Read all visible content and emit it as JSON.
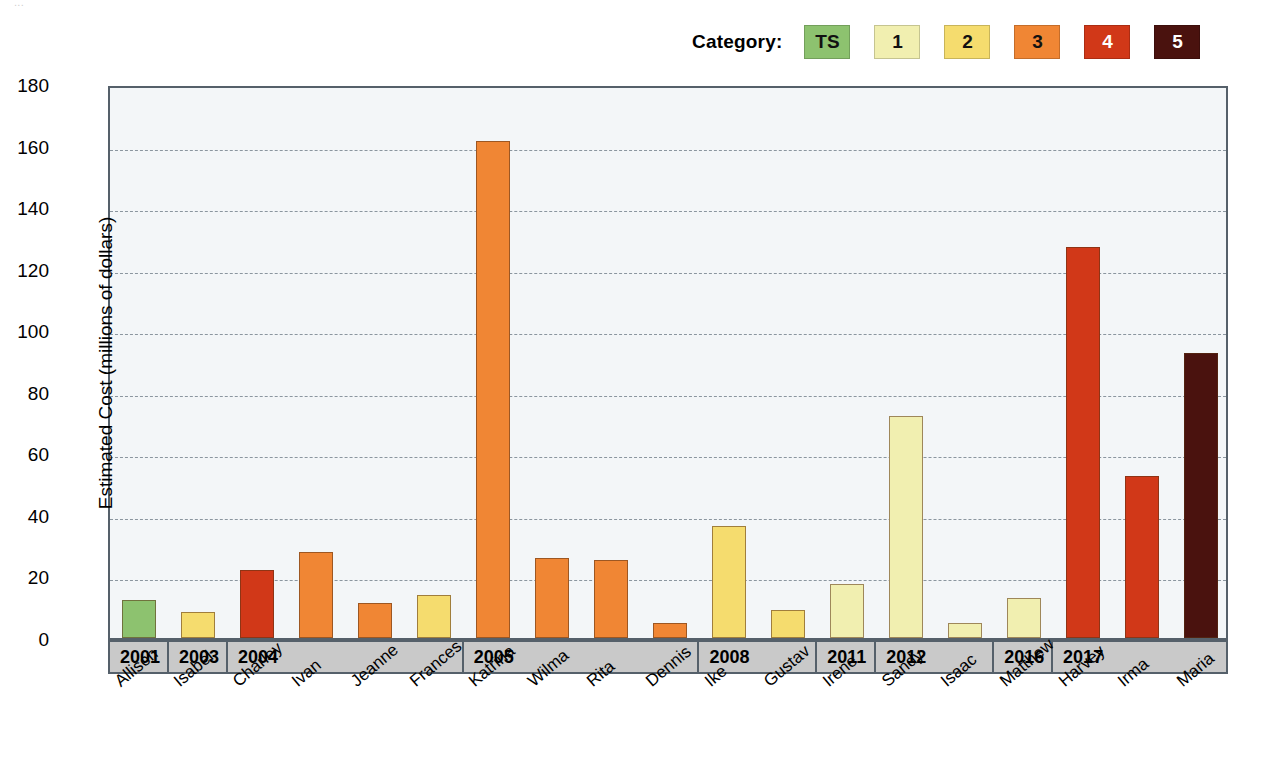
{
  "top_crumb": "...",
  "legend": {
    "label": "Category:",
    "items": [
      {
        "key": "TS",
        "text": "TS",
        "color": "#8DC26F",
        "text_color": "#111111"
      },
      {
        "key": "1",
        "text": "1",
        "color": "#F1EFB0",
        "text_color": "#111111"
      },
      {
        "key": "2",
        "text": "2",
        "color": "#F5DC6E",
        "text_color": "#111111"
      },
      {
        "key": "3",
        "text": "3",
        "color": "#F08634",
        "text_color": "#111111"
      },
      {
        "key": "4",
        "text": "4",
        "color": "#D13818",
        "text_color": "#ffffff"
      },
      {
        "key": "5",
        "text": "5",
        "color": "#4A120E",
        "text_color": "#ffffff"
      }
    ]
  },
  "chart_data": {
    "type": "bar",
    "title": "",
    "xlabel": "",
    "ylabel": "Estimated Cost (millions of dollars)",
    "ylim": [
      0,
      180
    ],
    "yticks": [
      0,
      20,
      40,
      60,
      80,
      100,
      120,
      140,
      160,
      180
    ],
    "grid": true,
    "legend_position": "top-right",
    "categories": [
      "Allison",
      "Isabel",
      "Charley",
      "Ivan",
      "Jeanne",
      "Frances",
      "Katrina",
      "Wilma",
      "Rita",
      "Dennis",
      "Ike",
      "Gustav",
      "Irene",
      "Sandy",
      "Isaac",
      "Matthew",
      "Harvey",
      "Irma",
      "Maria"
    ],
    "values": [
      12.5,
      8.5,
      22,
      28,
      11.5,
      14,
      161.5,
      26,
      25.5,
      5,
      36.5,
      9,
      17.5,
      72,
      5,
      13,
      127,
      52.5,
      92.5
    ],
    "point_categories": [
      "TS",
      "2",
      "4",
      "3",
      "3",
      "2",
      "3",
      "3",
      "3",
      "3",
      "2",
      "2",
      "1",
      "1",
      "1",
      "1",
      "4",
      "4",
      "5"
    ],
    "years": [
      "2001",
      "2003",
      "2004",
      "2004",
      "2004",
      "2004",
      "2005",
      "2005",
      "2005",
      "2005",
      "2008",
      "2008",
      "2011",
      "2012",
      "2012",
      "2016",
      "2017",
      "2017",
      "2017"
    ],
    "year_groups": [
      {
        "year": "2001",
        "count": 1
      },
      {
        "year": "2003",
        "count": 1
      },
      {
        "year": "2004",
        "count": 4
      },
      {
        "year": "2005",
        "count": 4
      },
      {
        "year": "2008",
        "count": 2
      },
      {
        "year": "2011",
        "count": 1
      },
      {
        "year": "2012",
        "count": 2
      },
      {
        "year": "2016",
        "count": 1
      },
      {
        "year": "2017",
        "count": 3
      }
    ]
  }
}
